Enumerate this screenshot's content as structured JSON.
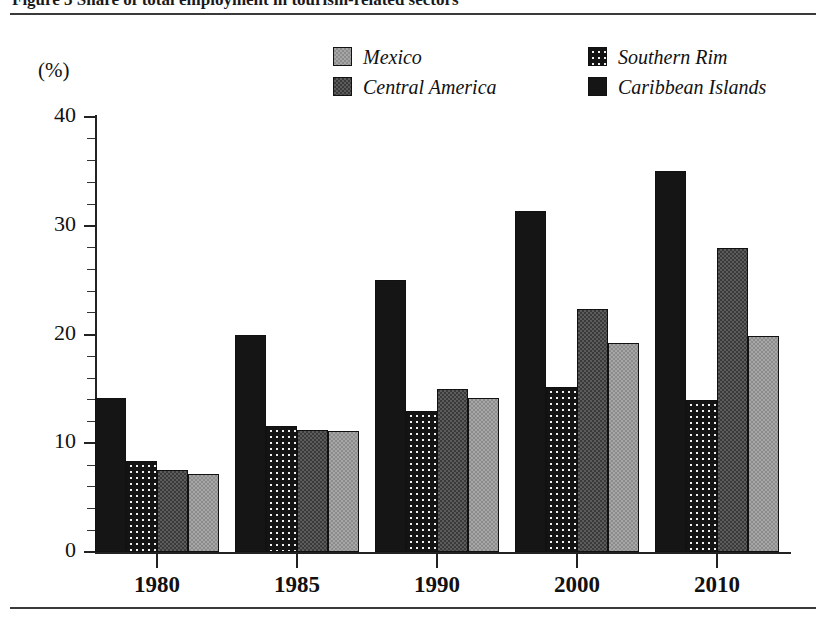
{
  "figure": {
    "title_partial": "Figure 3  Share of total employment in tourism-related sectors",
    "y_axis_unit": "(%)"
  },
  "legend": {
    "items": [
      {
        "label": "Mexico",
        "swatch": "light-gray-stipple",
        "color": "#a6a6a6"
      },
      {
        "label": "Central America",
        "swatch": "dark-gray-stipple",
        "color": "#3a3a3a"
      },
      {
        "label": "Southern Rim",
        "swatch": "black-with-white-dots",
        "color": "#141414"
      },
      {
        "label": "Caribbean Islands",
        "swatch": "solid-black",
        "color": "#151515"
      }
    ]
  },
  "axes": {
    "y_labels": [
      "0",
      "10",
      "20",
      "30",
      "40"
    ],
    "y_min": 0,
    "y_max": 40,
    "y_major_step": 10,
    "y_minor_step": 2,
    "x_labels": [
      "1980",
      "1985",
      "1990",
      "2000",
      "2010"
    ]
  },
  "chart_data": {
    "type": "bar",
    "title": "Share of total employment in tourism-related sectors",
    "xlabel": "",
    "ylabel": "(%)",
    "ylim": [
      0,
      40
    ],
    "grid": false,
    "legend_position": "top-center",
    "categories": [
      "1980",
      "1985",
      "1990",
      "2000",
      "2010"
    ],
    "series": [
      {
        "name": "Caribbean Islands",
        "color": "#151515",
        "values": [
          14.2,
          20.0,
          25.0,
          31.4,
          35.0
        ]
      },
      {
        "name": "Southern Rim",
        "color": "#141414",
        "values": [
          8.4,
          11.6,
          13.0,
          15.2,
          14.0
        ]
      },
      {
        "name": "Central America",
        "color": "#3a3a3a",
        "values": [
          7.5,
          11.2,
          15.0,
          22.3,
          28.0
        ]
      },
      {
        "name": "Mexico",
        "color": "#a6a6a6",
        "values": [
          7.2,
          11.1,
          14.2,
          19.2,
          19.9
        ]
      }
    ],
    "bar_order_within_group": [
      "Caribbean Islands",
      "Southern Rim",
      "Central America",
      "Mexico"
    ]
  }
}
